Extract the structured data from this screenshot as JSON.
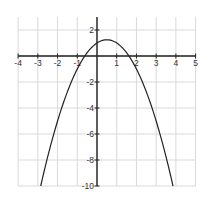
{
  "chart_data": {
    "type": "line",
    "title": "",
    "xlabel": "",
    "ylabel": "",
    "xlim": [
      -4,
      5
    ],
    "ylim": [
      -10,
      3
    ],
    "grid": true,
    "x_ticks": [
      -4,
      -3,
      -2,
      -1,
      1,
      2,
      3,
      4,
      5
    ],
    "x_tick_labels": [
      "-4",
      "-3",
      "-2",
      "-1",
      "1",
      "2",
      "3",
      "4",
      "5"
    ],
    "y_ticks": [
      2,
      -2,
      -4,
      -6,
      -8,
      -10
    ],
    "y_tick_labels": [
      "2",
      "-2",
      "-4",
      "-6",
      "-8",
      "-10"
    ],
    "series": [
      {
        "name": "parabola",
        "equation": "y = -x^2 + x + 1",
        "coefficients": {
          "a": -1,
          "b": 1,
          "c": 1
        },
        "x_range": [
          -2.85,
          3.85
        ],
        "vertex": [
          0.5,
          1.25
        ],
        "roots": [
          -0.618,
          1.618
        ],
        "y_intercept": 1,
        "color": "#222222"
      }
    ]
  },
  "layout": {
    "origin_px": [
      97,
      56
    ],
    "px_per_unit_x": 19.72,
    "px_per_unit_y": 13,
    "grid_color": "#d9d9d9",
    "axis_color": "#222222"
  }
}
